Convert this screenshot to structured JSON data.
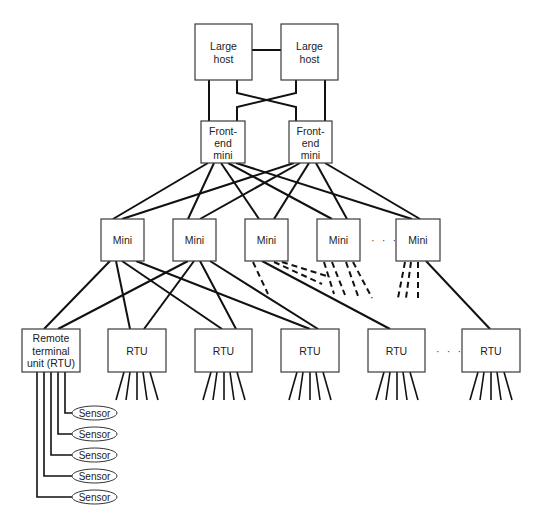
{
  "diagram": {
    "type": "hierarchical network topology",
    "colors": {
      "line": "#111111",
      "box_border": "#3a3a3a",
      "background": "#ffffff",
      "text": "#222222"
    },
    "hosts": [
      {
        "label_line1": "Large",
        "label_line2": "host"
      },
      {
        "label_line1": "Large",
        "label_line2": "host"
      }
    ],
    "front_end": [
      {
        "label_line1": "Front-",
        "label_line2": "end",
        "label_line3": "mini"
      },
      {
        "label_line1": "Front-",
        "label_line2": "end",
        "label_line3": "mini"
      }
    ],
    "minis": [
      {
        "label": "Mini"
      },
      {
        "label": "Mini"
      },
      {
        "label": "Mini"
      },
      {
        "label": "Mini"
      },
      {
        "label": "Mini"
      }
    ],
    "mini_ellipsis": "· · ·",
    "rtus": [
      {
        "label_line1": "Remote",
        "label_line2": "terminal",
        "label_line3": "unit (RTU)"
      },
      {
        "label": "RTU"
      },
      {
        "label": "RTU"
      },
      {
        "label": "RTU"
      },
      {
        "label": "RTU"
      },
      {
        "label": "RTU"
      }
    ],
    "rtu_ellipsis": "· · ·",
    "sensors": [
      {
        "label": "Sensor"
      },
      {
        "label": "Sensor"
      },
      {
        "label": "Sensor"
      },
      {
        "label": "Sensor"
      },
      {
        "label": "Sensor"
      }
    ]
  }
}
